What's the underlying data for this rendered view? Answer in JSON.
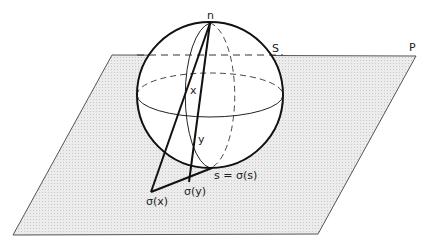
{
  "diagram": {
    "labels": {
      "north_pole": "n",
      "sphere": "S",
      "plane": "P",
      "point_x": "x",
      "point_y": "y",
      "proj_x": "σ(x)",
      "proj_y": "σ(y)",
      "fixed_point": "s = σ(s)"
    },
    "colors": {
      "plane_fill": "#e6e6e6",
      "plane_edge": "#555555",
      "stroke": "#111111",
      "background": "#ffffff"
    },
    "geometry": {
      "plane_corners": [
        [
          112,
          55
        ],
        [
          416,
          56
        ],
        [
          318,
          234
        ],
        [
          13,
          235
        ]
      ],
      "sphere_center": [
        210,
        95
      ],
      "sphere_radius": 73,
      "north_pole": [
        210,
        23
      ],
      "proj_x_point": [
        151,
        192
      ],
      "proj_y_point": [
        189,
        182
      ],
      "s_point": [
        212,
        168
      ]
    }
  }
}
